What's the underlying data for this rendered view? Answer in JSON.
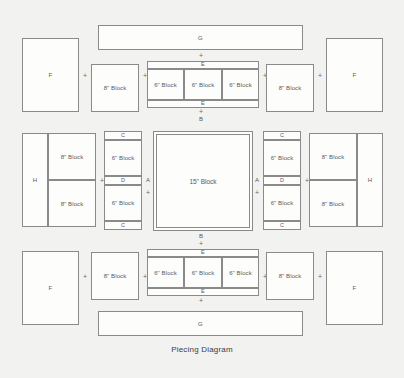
{
  "caption": "Piecing Diagram",
  "colors": {
    "background": "#f2f2f0",
    "line": "#8a8a8a",
    "fill": "#fdfdfc",
    "text": "#5a5a5a",
    "caption_text": "#3d3d3d"
  },
  "labels": {
    "block_6": "6\" Block",
    "block_8": "8\" Block",
    "block_15": "15\" Block",
    "A": "A",
    "B": "B",
    "C": "C",
    "D": "D",
    "E": "E",
    "F": "F",
    "G": "G",
    "H": "H",
    "plus": "+"
  },
  "rows": {
    "top_sash": {
      "label": "G"
    },
    "bottom_sash": {
      "label": "G"
    },
    "top_block_row": {
      "left_corner": "F",
      "left_8": "8\" Block",
      "center_strip_top": "E",
      "center_blocks": [
        "6\" Block",
        "6\" Block",
        "6\" Block"
      ],
      "center_strip_bottom": "E",
      "right_8": "8\" Block",
      "right_corner": "F"
    },
    "middle_row": {
      "left_H": "H",
      "left_8_top": "8\" Block",
      "left_8_bottom": "8\" Block",
      "left_col": [
        "C",
        "6\" Block",
        "D",
        "6\" Block",
        "C"
      ],
      "left_A": "A",
      "center": "15\" Block",
      "right_A": "A",
      "right_col": [
        "C",
        "6\" Block",
        "D",
        "6\" Block",
        "C"
      ],
      "right_8_top": "8\" Block",
      "right_8_bottom": "8\" Block",
      "right_H": "H"
    },
    "bottom_block_row": {
      "left_corner": "F",
      "left_8": "8\" Block",
      "center_strip_top": "E",
      "center_blocks": [
        "6\" Block",
        "6\" Block",
        "6\" Block"
      ],
      "center_strip_bottom": "E",
      "right_8": "8\" Block",
      "right_corner": "F"
    }
  },
  "joiners": {
    "top_g_plus": "+",
    "top_e_above": "E",
    "top_e_below": "E",
    "top_b_plus": "+",
    "top_b": "B",
    "bottom_b": "B",
    "bottom_b_plus": "+",
    "bottom_e_above": "E",
    "bottom_e_below": "E",
    "bottom_g_plus": "+",
    "row_plus_1": "+",
    "row_plus_2": "+",
    "row_plus_3": "+",
    "row_plus_4": "+",
    "row_plus_5": "+",
    "row_plus_6": "+",
    "row_plus_7": "+",
    "row_plus_8": "+",
    "mid_plus_left": "+",
    "mid_plus_right": "+",
    "a_plus_left": "+",
    "a_plus_right": "+",
    "e_plus_top": "+",
    "e_plus_bottom": "+"
  }
}
